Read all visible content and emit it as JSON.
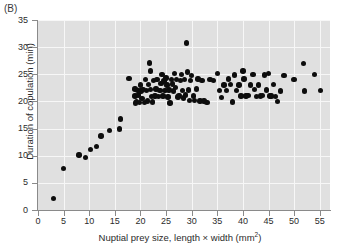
{
  "figure": {
    "panel_label": "(B)",
    "background_color": "#e0e0e0",
    "gridline_color": "#f7f7f7",
    "marker_color": "#0d0d0d"
  },
  "chart_data": {
    "type": "scatter",
    "title": "",
    "xlabel": "Nuptial prey size, length × width (mm",
    "xlabel_sup": "2",
    "xlabel_tail": ")",
    "ylabel": "Duration of copulation (min)",
    "xlim": [
      0,
      57
    ],
    "ylim": [
      0,
      35
    ],
    "xticks": [
      0,
      5,
      10,
      15,
      20,
      25,
      30,
      35,
      40,
      45,
      50,
      55
    ],
    "yticks": [
      0,
      5,
      10,
      15,
      20,
      25,
      30,
      35
    ],
    "grid": true,
    "legend": "none",
    "points": [
      [
        3.0,
        2.1
      ],
      [
        5.0,
        7.7
      ],
      [
        8.0,
        10.1
      ],
      [
        9.3,
        9.7
      ],
      [
        10.2,
        11.2
      ],
      [
        11.4,
        11.7
      ],
      [
        12.3,
        13.6
      ],
      [
        14.0,
        14.7
      ],
      [
        15.9,
        14.9
      ],
      [
        16.1,
        16.8
      ],
      [
        17.8,
        24.2
      ],
      [
        18.9,
        22.3
      ],
      [
        18.9,
        21.0
      ],
      [
        19.0,
        19.7
      ],
      [
        19.2,
        20.0
      ],
      [
        19.5,
        22.0
      ],
      [
        19.6,
        21.2
      ],
      [
        19.8,
        19.8
      ],
      [
        20.0,
        23.0
      ],
      [
        20.1,
        21.9
      ],
      [
        20.3,
        20.5
      ],
      [
        20.5,
        22.2
      ],
      [
        20.8,
        19.8
      ],
      [
        21.0,
        24.0
      ],
      [
        21.2,
        22.0
      ],
      [
        21.4,
        20.1
      ],
      [
        21.6,
        23.1
      ],
      [
        21.8,
        27.1
      ],
      [
        21.9,
        25.6
      ],
      [
        22.0,
        22.2
      ],
      [
        22.1,
        20.9
      ],
      [
        22.3,
        19.9
      ],
      [
        22.6,
        23.9
      ],
      [
        22.8,
        21.0
      ],
      [
        23.0,
        22.3
      ],
      [
        23.2,
        24.0
      ],
      [
        23.5,
        20.9
      ],
      [
        23.8,
        22.0
      ],
      [
        24.0,
        23.3
      ],
      [
        24.2,
        25.0
      ],
      [
        24.4,
        21.0
      ],
      [
        24.6,
        23.8
      ],
      [
        24.8,
        22.0
      ],
      [
        25.0,
        24.3
      ],
      [
        25.2,
        23.0
      ],
      [
        25.4,
        20.8
      ],
      [
        25.6,
        22.1
      ],
      [
        25.8,
        19.7
      ],
      [
        26.0,
        24.0
      ],
      [
        26.2,
        23.2
      ],
      [
        26.4,
        21.9
      ],
      [
        26.6,
        25.2
      ],
      [
        26.8,
        22.6
      ],
      [
        27.0,
        24.0
      ],
      [
        27.3,
        20.8
      ],
      [
        27.5,
        21.1
      ],
      [
        27.8,
        23.9
      ],
      [
        28.0,
        25.0
      ],
      [
        28.2,
        22.0
      ],
      [
        28.4,
        20.6
      ],
      [
        28.6,
        24.0
      ],
      [
        28.8,
        21.2
      ],
      [
        29.0,
        30.8
      ],
      [
        29.2,
        25.4
      ],
      [
        29.4,
        22.1
      ],
      [
        29.6,
        20.2
      ],
      [
        29.8,
        23.9
      ],
      [
        30.0,
        24.8
      ],
      [
        30.3,
        21.0
      ],
      [
        30.6,
        20.2
      ],
      [
        30.9,
        22.3
      ],
      [
        31.2,
        24.1
      ],
      [
        31.6,
        20.1
      ],
      [
        32.0,
        23.9
      ],
      [
        32.4,
        20.1
      ],
      [
        33.0,
        19.8
      ],
      [
        33.6,
        24.0
      ],
      [
        34.2,
        23.9
      ],
      [
        35.0,
        25.1
      ],
      [
        35.4,
        22.0
      ],
      [
        35.8,
        20.7
      ],
      [
        36.3,
        23.0
      ],
      [
        36.8,
        22.0
      ],
      [
        37.2,
        24.1
      ],
      [
        37.6,
        23.1
      ],
      [
        38.0,
        19.9
      ],
      [
        38.4,
        24.9
      ],
      [
        38.8,
        22.0
      ],
      [
        39.2,
        23.0
      ],
      [
        39.6,
        21.0
      ],
      [
        40.0,
        25.6
      ],
      [
        40.2,
        24.1
      ],
      [
        40.6,
        21.0
      ],
      [
        41.0,
        21.1
      ],
      [
        41.5,
        23.0
      ],
      [
        42.0,
        25.0
      ],
      [
        42.3,
        22.2
      ],
      [
        42.6,
        20.9
      ],
      [
        43.0,
        23.0
      ],
      [
        43.4,
        21.0
      ],
      [
        43.8,
        21.1
      ],
      [
        44.2,
        24.9
      ],
      [
        44.6,
        22.1
      ],
      [
        45.0,
        25.2
      ],
      [
        45.3,
        21.0
      ],
      [
        45.6,
        21.0
      ],
      [
        46.0,
        23.1
      ],
      [
        46.4,
        20.9
      ],
      [
        46.8,
        20.0
      ],
      [
        47.3,
        21.9
      ],
      [
        48.0,
        24.8
      ],
      [
        50.0,
        24.0
      ],
      [
        51.8,
        27.0
      ],
      [
        52.0,
        21.9
      ],
      [
        54.0,
        25.0
      ],
      [
        55.2,
        22.0
      ]
    ]
  }
}
